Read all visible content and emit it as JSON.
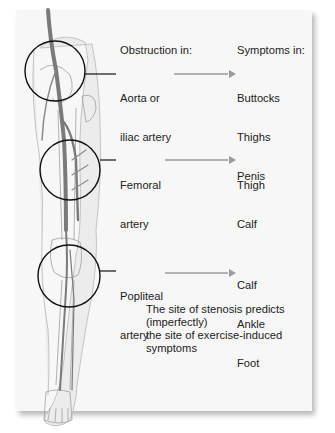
{
  "figure": {
    "headers": {
      "obstruction": "Obstruction in:",
      "symptoms": "Symptoms in:"
    },
    "sites": [
      {
        "obstruction_line1": "Aorta or",
        "obstruction_line2": "iliac artery",
        "symptoms": [
          "Buttocks",
          "Thighs",
          "Penis"
        ]
      },
      {
        "obstruction_line1": "Femoral",
        "obstruction_line2": "artery",
        "symptoms": [
          "Thigh",
          "Calf"
        ]
      },
      {
        "obstruction_line1": "Popliteal",
        "obstruction_line2": "artery",
        "symptoms": [
          "Calf",
          "Ankle",
          "Foot"
        ]
      }
    ],
    "caption_line1": "The site of stenosis predicts (imperfectly)",
    "caption_line2": "the site of exercise-induced symptoms",
    "colors": {
      "artery": "#7a7a7a",
      "arrow": "#9a9a9a",
      "circle": "#111111",
      "leg_outline": "#b5b5b5",
      "background": "#f7f7f7"
    }
  }
}
